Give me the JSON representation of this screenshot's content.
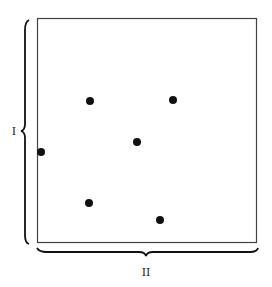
{
  "figure": {
    "width": 272,
    "height": 287,
    "background": "#ffffff",
    "box": {
      "x": 37,
      "y": 18,
      "width": 219,
      "height": 224,
      "stroke": "#444444"
    },
    "dot_color": "#111111",
    "dot_radius": 4,
    "dots": [
      {
        "id": "a",
        "x": 90,
        "y": 101
      },
      {
        "id": "b",
        "x": 173,
        "y": 100
      },
      {
        "id": "c",
        "x": 137,
        "y": 142
      },
      {
        "id": "d",
        "x": 89,
        "y": 203
      },
      {
        "id": "e",
        "x": 160,
        "y": 220
      },
      {
        "id": "f",
        "x": 41,
        "y": 152
      }
    ],
    "axis_labels": {
      "vertical": "I",
      "horizontal": "II"
    }
  }
}
